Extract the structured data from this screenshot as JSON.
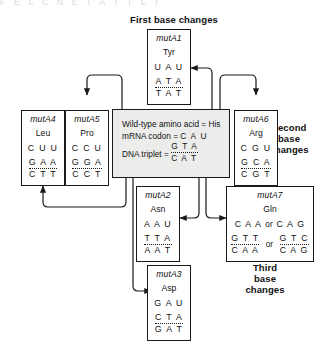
{
  "figure": {
    "scan_artifact_text": "F E L   C N E   T A T   T L T",
    "headings": {
      "first": "First base changes",
      "second": "Second\nbase\nchanges",
      "second_l1": "Second",
      "second_l2": "base",
      "second_l3": "changes",
      "third_l1": "Third",
      "third_l2": "base",
      "third_l3": "changes"
    },
    "wildtype": {
      "line1_label": "Wild-type amino acid =",
      "line1_value": "His",
      "line2_label": "mRNA codon =",
      "line2_value": "C A U",
      "line3_label": "DNA triplet =",
      "line3_top": "G T A",
      "line3_bottom": "C A T"
    },
    "mutants": [
      {
        "id": "mutA1",
        "name": "mutA1",
        "amino_acid": "Tyr",
        "mrna": "U A U",
        "dna_top": "A T A",
        "dna_bottom": "T A T"
      },
      {
        "id": "mutA4",
        "name": "mutA4",
        "amino_acid": "Leu",
        "mrna": "C U U",
        "dna_top": "G A A",
        "dna_bottom": "C T T"
      },
      {
        "id": "mutA5",
        "name": "mutA5",
        "amino_acid": "Pro",
        "mrna": "C C U",
        "dna_top": "G G A",
        "dna_bottom": "C C T"
      },
      {
        "id": "mutA6",
        "name": "mutA6",
        "amino_acid": "Arg",
        "mrna": "C G U",
        "dna_top": "G C A",
        "dna_bottom": "C G T"
      },
      {
        "id": "mutA2",
        "name": "mutA2",
        "amino_acid": "Asn",
        "mrna": "A A U",
        "dna_top": "T T A",
        "dna_bottom": "A A T"
      },
      {
        "id": "mutA3",
        "name": "mutA3",
        "amino_acid": "Asp",
        "mrna": "G A U",
        "dna_top": "C T A",
        "dna_bottom": "G A T"
      },
      {
        "id": "mutA7",
        "name": "mutA7",
        "amino_acid": "Gln",
        "mrna_a": "C A A",
        "mrna_or": "or",
        "mrna_b": "C A G",
        "dna_a_top": "G T T",
        "dna_a_bottom": "C A A",
        "dna_or": "or",
        "dna_b_top": "G T C",
        "dna_b_bottom": "C A G"
      }
    ],
    "colors": {
      "line": "#1a1a1a",
      "panel_fill": "#ececeb",
      "box_fill": "#ffffff",
      "text": "#111111",
      "background": "#ffffff"
    }
  }
}
